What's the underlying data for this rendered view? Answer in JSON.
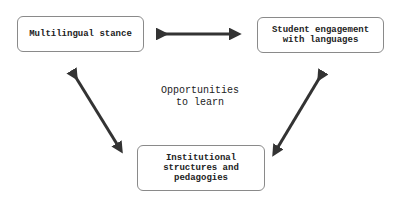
{
  "diagram": {
    "nodes": [
      {
        "id": "multilingual-stance",
        "label": "Multilingual stance"
      },
      {
        "id": "student-engagement",
        "label": "Student engagement\nwith languages"
      },
      {
        "id": "institutional-structures",
        "label": "Institutional\nstructures and\npedagogies"
      }
    ],
    "center_label": "Opportunities\nto learn",
    "edges": [
      {
        "from": "multilingual-stance",
        "to": "student-engagement",
        "type": "bidirectional"
      },
      {
        "from": "multilingual-stance",
        "to": "institutional-structures",
        "type": "bidirectional"
      },
      {
        "from": "student-engagement",
        "to": "institutional-structures",
        "type": "bidirectional"
      }
    ],
    "colors": {
      "arrow": "#333333",
      "box_border": "#8a8a8a",
      "text": "#222222"
    }
  }
}
